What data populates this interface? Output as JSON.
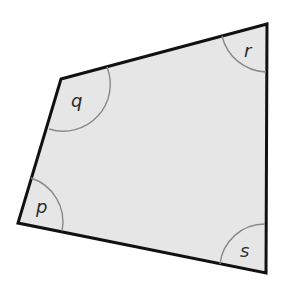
{
  "diagram": {
    "type": "quadrilateral",
    "fill": "#e6e6e6",
    "stroke": "#111111",
    "arc_color": "#8a8a8a",
    "vertices": {
      "p": [
        18,
        223
      ],
      "q": [
        61,
        79
      ],
      "r": [
        267,
        24
      ],
      "s": [
        266,
        273
      ]
    },
    "angle_labels": {
      "p": "p",
      "q": "q",
      "r": "r",
      "s": "s"
    }
  }
}
